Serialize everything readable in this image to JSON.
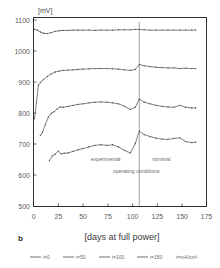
{
  "figure": {
    "panel_label": "b"
  },
  "chart_data": {
    "type": "line",
    "title": "",
    "subtitle": "",
    "xlabel": "[days at full power]",
    "ylabel": "",
    "yunit": "[mV]",
    "xlim": [
      0,
      175
    ],
    "ylim": [
      500,
      1100
    ],
    "xticks": [
      0,
      25,
      50,
      75,
      100,
      125,
      150,
      175
    ],
    "yticks": [
      500,
      600,
      700,
      800,
      900,
      1000,
      1100
    ],
    "grid": false,
    "legend_position": "bottom",
    "legend_unit": "i=mA/cm²",
    "annotations": [
      {
        "text": "experimental",
        "x": 88,
        "y": 643
      },
      {
        "text": "nominal",
        "x": 120,
        "y": 643
      },
      {
        "text": "operating conditions",
        "x": 104,
        "y": 607
      }
    ],
    "vline": {
      "x": 107,
      "label": "boundary between experimental and nominal operating conditions"
    },
    "series": [
      {
        "name": "i=0",
        "x": [
          1,
          4,
          7,
          10,
          14,
          18,
          22,
          26,
          30,
          35,
          40,
          45,
          50,
          56,
          62,
          68,
          74,
          80,
          86,
          92,
          98,
          103,
          107,
          112,
          118,
          124,
          130,
          136,
          142,
          148,
          154,
          160,
          164
        ],
        "values": [
          1062,
          1060,
          1054,
          1050,
          1049,
          1052,
          1056,
          1058,
          1059,
          1059,
          1060,
          1060,
          1060,
          1060,
          1059,
          1060,
          1060,
          1060,
          1061,
          1061,
          1061,
          1062,
          1062,
          1061,
          1060,
          1060,
          1060,
          1060,
          1060,
          1060,
          1060,
          1060,
          1060
        ]
      },
      {
        "name": "i=50",
        "x": [
          1,
          3,
          5,
          7,
          10,
          14,
          18,
          22,
          26,
          30,
          35,
          40,
          45,
          50,
          56,
          62,
          68,
          74,
          80,
          86,
          92,
          98,
          103,
          107,
          112,
          118,
          124,
          130,
          136,
          142,
          148,
          154,
          160,
          164
        ],
        "values": [
          779,
          830,
          886,
          893,
          903,
          913,
          921,
          927,
          930,
          932,
          933,
          934,
          935,
          936,
          937,
          938,
          938,
          938,
          937,
          936,
          934,
          932,
          935,
          951,
          947,
          944,
          942,
          941,
          940,
          940,
          938,
          939,
          938,
          938
        ]
      },
      {
        "name": "i=100",
        "x": [
          7,
          9,
          12,
          15,
          18,
          21,
          24,
          27,
          30,
          35,
          40,
          45,
          50,
          56,
          62,
          68,
          74,
          80,
          86,
          92,
          98,
          103,
          107,
          112,
          118,
          124,
          130,
          136,
          142,
          148,
          154,
          160,
          164
        ],
        "values": [
          726,
          735,
          760,
          784,
          796,
          801,
          810,
          816,
          815,
          818,
          821,
          824,
          826,
          829,
          831,
          832,
          831,
          829,
          826,
          818,
          808,
          815,
          841,
          831,
          826,
          821,
          818,
          816,
          815,
          821,
          815,
          813,
          813
        ]
      },
      {
        "name": "i=150",
        "x": [
          16,
          19,
          22,
          25,
          28,
          31,
          35,
          40,
          45,
          50,
          56,
          62,
          68,
          74,
          80,
          86,
          92,
          98,
          103,
          107,
          112,
          118,
          124,
          130,
          136,
          142,
          148,
          154,
          160,
          164
        ],
        "values": [
          645,
          661,
          666,
          676,
          667,
          669,
          670,
          675,
          680,
          684,
          689,
          694,
          696,
          694,
          696,
          689,
          678,
          670,
          700,
          739,
          728,
          722,
          717,
          714,
          713,
          716,
          718,
          706,
          703,
          704
        ]
      }
    ]
  },
  "legend": {
    "items": [
      {
        "label": "i=0"
      },
      {
        "label": "i=50"
      },
      {
        "label": "i=100"
      },
      {
        "label": "i=150"
      }
    ],
    "unit": "i=mA/cm²"
  },
  "colors": {
    "line": "#4a4a4a",
    "frame": "#2f2f2f",
    "text": "#5a5a5a",
    "annotation": "#6b6b6b",
    "background": "#ffffff"
  }
}
